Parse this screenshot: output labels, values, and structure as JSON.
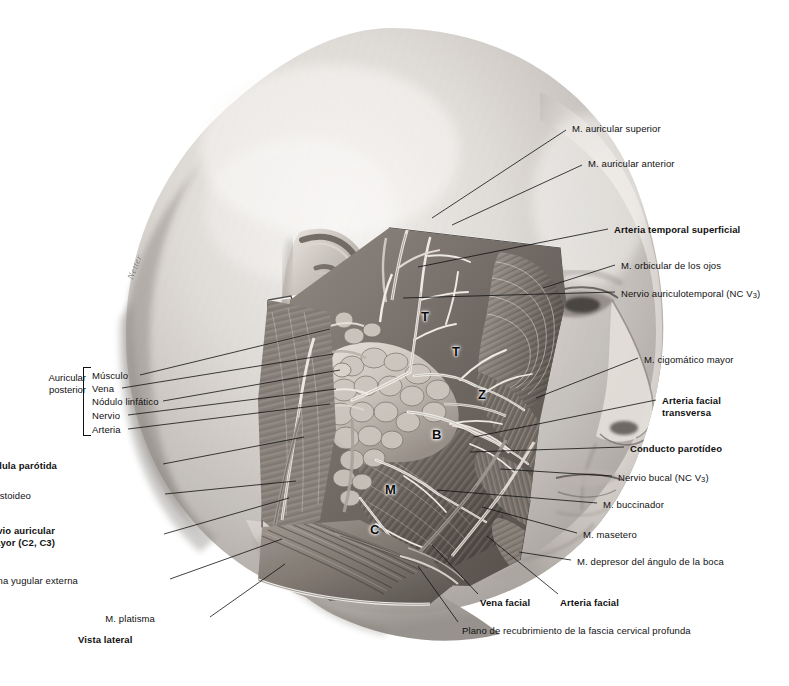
{
  "plate": {
    "view_caption": "Vista lateral",
    "signature": "Netter",
    "background": "#ffffff",
    "ink": "#111111"
  },
  "markers": [
    {
      "letter": "T",
      "x": 421,
      "y": 310,
      "meaning": "rama temporal"
    },
    {
      "letter": "T",
      "x": 452,
      "y": 345,
      "meaning": "rama temporal"
    },
    {
      "letter": "Z",
      "x": 478,
      "y": 388,
      "meaning": "rama cigomatica"
    },
    {
      "letter": "B",
      "x": 432,
      "y": 428,
      "meaning": "rama bucal"
    },
    {
      "letter": "M",
      "x": 385,
      "y": 483,
      "meaning": "rama marginal mandibular"
    },
    {
      "letter": "C",
      "x": 370,
      "y": 523,
      "meaning": "rama cervical"
    }
  ],
  "labels_right": [
    {
      "text": "M. auricular superior",
      "bold": false,
      "x": 572,
      "y": 123,
      "lx1": 566,
      "ly1": 130,
      "lx2": 432,
      "ly2": 218
    },
    {
      "text": "M. auricular anterior",
      "bold": false,
      "x": 588,
      "y": 158,
      "lx1": 582,
      "ly1": 165,
      "lx2": 452,
      "ly2": 225
    },
    {
      "text": "Arteria temporal superficial",
      "bold": true,
      "x": 614,
      "y": 224,
      "lx1": 608,
      "ly1": 229,
      "lx2": 418,
      "ly2": 267
    },
    {
      "text": "M. orbicular de los ojos",
      "bold": false,
      "x": 621,
      "y": 260,
      "lx1": 615,
      "ly1": 265,
      "lx2": 543,
      "ly2": 288
    },
    {
      "text": "Nervio auriculotemporal (NC V3)",
      "bold": false,
      "sub": "3",
      "x": 621,
      "y": 288,
      "lx1": 615,
      "ly1": 292,
      "lx2": 403,
      "ly2": 298
    },
    {
      "text": "M. cigomático mayor",
      "bold": false,
      "x": 644,
      "y": 354,
      "lx1": 638,
      "ly1": 358,
      "lx2": 536,
      "ly2": 398
    },
    {
      "text": "Arteria facial transversa",
      "bold": true,
      "x": 662,
      "y": 395,
      "lx1": 656,
      "ly1": 400,
      "lx2": 474,
      "ly2": 437
    },
    {
      "text": "Conducto parotídeo",
      "bold": true,
      "x": 630,
      "y": 443,
      "lx1": 624,
      "ly1": 447,
      "lx2": 470,
      "ly2": 452
    },
    {
      "text": "Nervio bucal (NC V3)",
      "bold": false,
      "sub": "3",
      "x": 618,
      "y": 472,
      "lx1": 612,
      "ly1": 476,
      "lx2": 500,
      "ly2": 469
    },
    {
      "text": "M. buccinador",
      "bold": false,
      "x": 603,
      "y": 499,
      "lx1": 597,
      "ly1": 503,
      "lx2": 437,
      "ly2": 490
    },
    {
      "text": "M. masetero",
      "bold": false,
      "x": 583,
      "y": 529,
      "lx1": 577,
      "ly1": 533,
      "lx2": 482,
      "ly2": 507
    },
    {
      "text": "M. depresor del ángulo de la boca",
      "bold": false,
      "x": 577,
      "y": 556,
      "lx1": 571,
      "ly1": 560,
      "lx2": 519,
      "ly2": 552
    }
  ],
  "labels_bottom": [
    {
      "text": "Vena facial",
      "bold": true,
      "x": 480,
      "y": 597,
      "lx1": 478,
      "ly1": 594,
      "lx2": 432,
      "ly2": 545
    },
    {
      "text": "Arteria facial",
      "bold": true,
      "x": 560,
      "y": 597,
      "lx1": 558,
      "ly1": 594,
      "lx2": 487,
      "ly2": 536
    },
    {
      "text": "Plano de recubrimiento de la fascia cervical profunda",
      "bold": false,
      "x": 462,
      "y": 625,
      "lx1": 458,
      "ly1": 622,
      "lx2": 418,
      "ly2": 566
    }
  ],
  "labels_left": [
    {
      "text": "Glándula parótida",
      "bold": true,
      "x": 57,
      "y": 460,
      "lx1": 163,
      "ly1": 464,
      "lx2": 304,
      "ly2": 437
    },
    {
      "text": "M. esternocleidomastoideo",
      "bold": false,
      "x": 31,
      "y": 490,
      "lx1": 165,
      "ly1": 494,
      "lx2": 296,
      "ly2": 481
    },
    {
      "text": "Nervio auricular mayor (C2, C3)",
      "bold": true,
      "x": 55,
      "y": 525,
      "lx1": 164,
      "ly1": 534,
      "lx2": 289,
      "ly2": 498
    },
    {
      "text": "Vena yugular externa",
      "bold": false,
      "x": 78,
      "y": 575,
      "lx1": 170,
      "ly1": 579,
      "lx2": 282,
      "ly2": 539
    },
    {
      "text": "M. platisma",
      "bold": false,
      "x": 155,
      "y": 613,
      "lx1": 210,
      "ly1": 617,
      "lx2": 285,
      "ly2": 564
    }
  ],
  "group_auricular": {
    "title_line1": "Auricular",
    "title_line2": "posterior",
    "title_x": 40,
    "title_y": 372,
    "bracket": {
      "x": 83,
      "y": 367,
      "w": 7,
      "h": 67
    },
    "items": [
      {
        "text": "Músculo",
        "x": 92,
        "y": 370,
        "lx1": 140,
        "ly1": 375,
        "lx2": 330,
        "ly2": 329
      },
      {
        "text": "Vena",
        "x": 92,
        "y": 383,
        "lx1": 122,
        "ly1": 388,
        "lx2": 333,
        "ly2": 354
      },
      {
        "text": "Nódulo linfático",
        "x": 92,
        "y": 396,
        "lx1": 163,
        "ly1": 401,
        "lx2": 340,
        "ly2": 370
      },
      {
        "text": "Nervio",
        "x": 92,
        "y": 410,
        "lx1": 128,
        "ly1": 415,
        "lx2": 336,
        "ly2": 389
      },
      {
        "text": "Arteria",
        "x": 92,
        "y": 424,
        "lx1": 128,
        "ly1": 429,
        "lx2": 330,
        "ly2": 404
      }
    ]
  }
}
